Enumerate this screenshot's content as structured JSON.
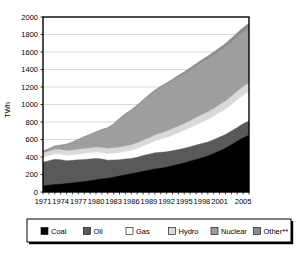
{
  "chart_data": {
    "type": "area",
    "stacked": true,
    "title": "",
    "xlabel": "",
    "ylabel": "TWh",
    "ylim": [
      0,
      2000
    ],
    "ytick_step": 200,
    "yticks": [
      "0",
      "200",
      "400",
      "600",
      "800",
      "1000",
      "1200",
      "1400",
      "1600",
      "1800",
      "2000"
    ],
    "xlim": [
      1971,
      2006
    ],
    "xticks": [
      "1971",
      "1974",
      "1977",
      "1980",
      "1983",
      "1986",
      "1989",
      "1992",
      "1995",
      "1998",
      "2001",
      "2005"
    ],
    "x": [
      1971,
      1972,
      1973,
      1974,
      1975,
      1976,
      1977,
      1978,
      1979,
      1980,
      1981,
      1982,
      1983,
      1984,
      1985,
      1986,
      1987,
      1988,
      1989,
      1990,
      1991,
      1992,
      1993,
      1994,
      1995,
      1996,
      1997,
      1998,
      1999,
      2000,
      2001,
      2002,
      2003,
      2004,
      2005,
      2006
    ],
    "grid": "horizontal",
    "legend_position": "bottom",
    "series": [
      {
        "name": "Coal",
        "color": "#000000",
        "values": [
          70,
          78,
          86,
          90,
          96,
          104,
          112,
          120,
          128,
          140,
          150,
          158,
          170,
          182,
          196,
          208,
          222,
          236,
          248,
          262,
          272,
          284,
          300,
          316,
          332,
          352,
          372,
          392,
          412,
          440,
          470,
          500,
          540,
          580,
          620,
          650
        ]
      },
      {
        "name": "Oil",
        "color": "#595959",
        "values": [
          270,
          278,
          288,
          280,
          262,
          258,
          256,
          252,
          250,
          244,
          226,
          206,
          196,
          188,
          182,
          176,
          176,
          180,
          184,
          186,
          182,
          176,
          172,
          170,
          168,
          166,
          164,
          162,
          160,
          158,
          158,
          156,
          156,
          158,
          160,
          162
        ]
      },
      {
        "name": "Gas",
        "color": "#ffffff",
        "values": [
          56,
          56,
          58,
          58,
          58,
          60,
          62,
          64,
          66,
          68,
          70,
          72,
          74,
          78,
          82,
          88,
          96,
          106,
          118,
          132,
          146,
          160,
          174,
          188,
          200,
          214,
          228,
          242,
          254,
          264,
          276,
          288,
          300,
          312,
          322,
          332
        ]
      },
      {
        "name": "Hydro",
        "color": "#d9d9d9",
        "values": [
          50,
          52,
          54,
          54,
          56,
          56,
          58,
          58,
          58,
          60,
          60,
          62,
          62,
          64,
          64,
          64,
          66,
          68,
          68,
          70,
          72,
          74,
          76,
          78,
          80,
          82,
          84,
          86,
          88,
          90,
          92,
          94,
          96,
          98,
          100,
          102
        ]
      },
      {
        "name": "Nuclear",
        "color": "#9e9e9e",
        "values": [
          18,
          26,
          36,
          50,
          72,
          86,
          108,
          132,
          150,
          170,
          200,
          228,
          268,
          318,
          360,
          392,
          420,
          450,
          478,
          500,
          520,
          536,
          548,
          560,
          570,
          580,
          590,
          600,
          608,
          614,
          618,
          620,
          622,
          624,
          626,
          628
        ]
      },
      {
        "name": "Other**",
        "color": "#8c8c8c",
        "values": [
          6,
          6,
          6,
          6,
          6,
          8,
          8,
          8,
          8,
          8,
          10,
          10,
          10,
          12,
          12,
          12,
          14,
          14,
          16,
          16,
          18,
          18,
          20,
          22,
          24,
          26,
          28,
          30,
          32,
          34,
          36,
          40,
          44,
          48,
          52,
          56
        ]
      }
    ],
    "legend_entries": [
      {
        "label": "Coal",
        "color": "#000000"
      },
      {
        "label": "Oil",
        "color": "#595959"
      },
      {
        "label": "Gas",
        "color": "#ffffff"
      },
      {
        "label": "Hydro",
        "color": "#d9d9d9"
      },
      {
        "label": "Nuclear",
        "color": "#9e9e9e"
      },
      {
        "label": "Other**",
        "color": "#8c8c8c"
      }
    ]
  }
}
